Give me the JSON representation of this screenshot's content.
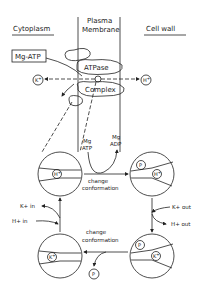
{
  "regions": {
    "cytoplasm": "Cytoplasm",
    "membrane_line1": "Plasma",
    "membrane_line2": "Membrane",
    "cell_wall": "Cell wall"
  },
  "complex": {
    "substrate": "Mg-ATP",
    "upper": "ATPase",
    "lower": "Complex",
    "ion_left": "K+",
    "ion_right": "H+"
  },
  "cycle": {
    "mg_atp_line1": "Mg",
    "mg_atp_line2": "ATP",
    "mg_adp_line1": "Mg",
    "mg_adp_line2": "ADP",
    "top_arrow_line1": "change",
    "top_arrow_line2": "conformation",
    "bottom_arrow_line1": "change",
    "bottom_arrow_line2": "conformation",
    "k_in": "K+ in",
    "h_in": "H+ in",
    "k_out": "K+ out",
    "h_out": "H+ out",
    "released_p": "P"
  },
  "states": [
    {
      "position": "top-left",
      "bound": [
        "H+"
      ]
    },
    {
      "position": "top-right",
      "bound": [
        "P",
        "H+"
      ]
    },
    {
      "position": "bottom-right",
      "bound": [
        "P",
        "K+"
      ]
    },
    {
      "position": "bottom-left",
      "bound": [
        "K+"
      ]
    }
  ],
  "glyphs": {
    "p": "P",
    "h": "H",
    "k": "K",
    "plus": "+"
  }
}
